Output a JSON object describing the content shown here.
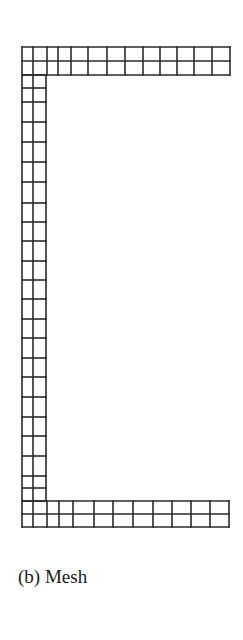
{
  "figure": {
    "caption": "(b) Mesh",
    "line_color": "#2a2a2a",
    "background": "#ffffff"
  },
  "mesh": {
    "description": "C-channel cross-section finite element mesh",
    "top_flange": {
      "x_lines": [
        22,
        33,
        47,
        58,
        71,
        88,
        107,
        125,
        143,
        160,
        177,
        194,
        212,
        230
      ],
      "y_lines": [
        47,
        61,
        75
      ]
    },
    "web": {
      "x_lines": [
        22,
        33,
        46
      ],
      "y_lines": [
        75,
        88,
        102,
        122,
        142,
        162,
        182,
        203,
        222,
        241,
        261,
        280,
        299,
        319,
        338,
        358,
        377,
        397,
        417,
        436,
        456,
        476,
        488,
        501
      ]
    },
    "bottom_flange": {
      "x_lines": [
        22,
        33,
        47,
        59,
        73,
        94,
        113,
        133,
        153,
        172,
        191,
        210,
        229
      ],
      "y_lines": [
        501,
        514,
        527
      ]
    }
  }
}
